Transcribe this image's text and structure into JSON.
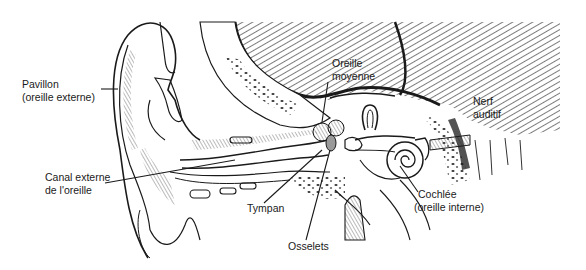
{
  "diagram": {
    "labels": {
      "pavillon": {
        "line1": "Pavillon",
        "line2": "(oreille externe)"
      },
      "canal": {
        "line1": "Canal externe",
        "line2": "de l'oreille"
      },
      "tympan": {
        "line1": "Tympan"
      },
      "osselets": {
        "line1": "Osselets"
      },
      "oreille_moyenne": {
        "line1": "Oreille",
        "line2": "moyenne"
      },
      "nerf": {
        "line1": "Nerf",
        "line2": "auditif"
      },
      "cochlee": {
        "line1": "Cochlée",
        "line2": "(oreille interne)"
      }
    },
    "colors": {
      "ink": "#1a1a1a",
      "background": "#ffffff",
      "hatch": "#333333"
    }
  }
}
